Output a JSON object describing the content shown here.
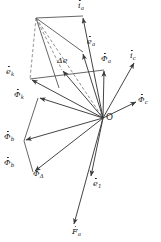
{
  "figure": {
    "type": "phasor-diagram",
    "background_color": "#ffffff",
    "line_color": "#3a3a3a",
    "dashed_color": "#5a5a5a",
    "text_color": "#1a1a1a",
    "width": 161,
    "height": 242,
    "origin_label": "O",
    "origin_point": {
      "x": 103,
      "y": 118
    }
  },
  "labels": {
    "origin": "O",
    "i_a": "i",
    "i_a_sub": "a",
    "e_a": "e",
    "e_a_sub": "a",
    "delta_e": "Δe",
    "phi_a": "Φ",
    "phi_a_sub": "a",
    "i_c": "i",
    "i_c_sub": "c",
    "phi_c": "Φ",
    "phi_c_sub": "c",
    "e_k": "e",
    "e_k_sub": "k",
    "phi_k": "Φ",
    "phi_k_sub": "k",
    "phi_b_upper": "Φ",
    "phi_b_upper_sub": "b",
    "phi_b_lower": "Φ",
    "phi_b_lower_sub": "b",
    "phi_delta": "Φ",
    "phi_delta_sub": "Δ",
    "e_1": "e",
    "e_1_sub": "1",
    "F_a": "F",
    "F_a_sub": "a"
  },
  "chart_data": {
    "type": "scatter",
    "title": "",
    "xlabel": "",
    "ylabel": "",
    "grid": false,
    "legend": "none",
    "origin": {
      "x": 103,
      "y": 118
    },
    "vectors": [
      {
        "name": "i_a",
        "label": "i̇a",
        "tip_x": 83,
        "tip_y": 16,
        "style": "solid",
        "arrow": true
      },
      {
        "name": "e_a",
        "label": "ėa",
        "tip_x": 83,
        "tip_y": 52,
        "style": "solid",
        "arrow": true
      },
      {
        "name": "phi_a",
        "label": "Φa",
        "tip_x": 104,
        "tip_y": 70,
        "style": "solid",
        "arrow": true
      },
      {
        "name": "i_c",
        "label": "i̇c",
        "tip_x": 135,
        "tip_y": 62,
        "style": "solid",
        "arrow": true
      },
      {
        "name": "phi_c",
        "label": "Φc",
        "tip_x": 137,
        "tip_y": 101,
        "style": "solid",
        "arrow": true
      },
      {
        "name": "e_1",
        "label": "ė1",
        "tip_x": 91,
        "tip_y": 178,
        "style": "solid",
        "arrow": true
      },
      {
        "name": "F_a",
        "label": "Ḟa",
        "tip_x": 73,
        "tip_y": 226,
        "style": "solid",
        "arrow": true
      },
      {
        "name": "phi_delta",
        "label": "ΦΔ",
        "tip_x": 33,
        "tip_y": 172,
        "style": "solid",
        "arrow": true
      },
      {
        "name": "phi_b",
        "label": "Φb",
        "tip_x": 24,
        "tip_y": 141,
        "style": "solid",
        "arrow": true
      },
      {
        "name": "phi_k",
        "label": "Φk",
        "tip_x": 38,
        "tip_y": 98,
        "style": "solid",
        "arrow": true
      },
      {
        "name": "e_k",
        "label": "ėk",
        "tip_x": 30,
        "tip_y": 79,
        "style": "solid",
        "arrow": true
      },
      {
        "name": "delta_e",
        "label": "Δe",
        "tip_x": 62,
        "tip_y": 70,
        "style": "solid",
        "arrow": true
      }
    ],
    "construction_lines": [
      {
        "from_x": 36,
        "from_y": 18,
        "to_x": 83,
        "to_y": 16,
        "style": "solid"
      },
      {
        "from_x": 36,
        "from_y": 18,
        "to_x": 83,
        "to_y": 52,
        "style": "solid"
      },
      {
        "from_x": 36,
        "from_y": 18,
        "to_x": 30,
        "to_y": 79,
        "style": "dashed"
      },
      {
        "from_x": 36,
        "from_y": 18,
        "to_x": 62,
        "to_y": 70,
        "style": "dashed"
      },
      {
        "from_x": 36,
        "from_y": 18,
        "to_x": 103,
        "to_y": 118,
        "style": "dashed"
      },
      {
        "from_x": 36,
        "from_y": 18,
        "to_x": 59,
        "to_y": 88,
        "style": "solid"
      },
      {
        "from_x": 30,
        "from_y": 79,
        "to_x": 104,
        "to_y": 70,
        "style": "solid"
      },
      {
        "from_x": 24,
        "from_y": 141,
        "to_x": 33,
        "to_y": 172,
        "style": "solid"
      },
      {
        "from_x": 38,
        "from_y": 98,
        "to_x": 24,
        "to_y": 141,
        "style": "solid"
      }
    ]
  }
}
